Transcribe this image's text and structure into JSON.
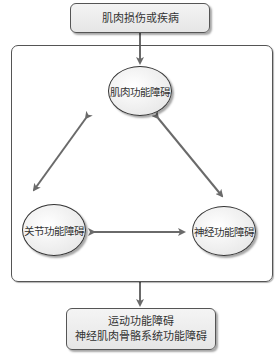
{
  "top_box": {
    "label": "肌肉损伤或疾病"
  },
  "nodes": {
    "top": {
      "label": "肌肉功能障碍"
    },
    "left": {
      "label": "关节功能障碍"
    },
    "right": {
      "label": "神经功能障碍"
    }
  },
  "bottom_box": {
    "lines": [
      "运动功能障碍",
      "神经肌肉骨骼系统功能障碍"
    ]
  },
  "colors": {
    "stroke": "#555555",
    "arrow": "#6a6a6a",
    "fill": "#eeeeee"
  }
}
